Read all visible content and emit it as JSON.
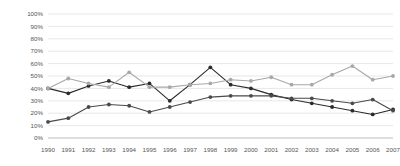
{
  "chart_data": {
    "type": "line",
    "title": "",
    "subtitle": "",
    "xlabel": "",
    "ylabel": "",
    "grid": true,
    "legend": "none",
    "ylim": [
      0,
      100
    ],
    "y_ticks": [
      "0%",
      "10%",
      "20%",
      "30%",
      "40%",
      "50%",
      "60%",
      "70%",
      "80%",
      "90%",
      "100%"
    ],
    "y_tick_values": [
      0,
      10,
      20,
      30,
      40,
      50,
      60,
      70,
      80,
      90,
      100
    ],
    "categories": [
      "1990",
      "1991",
      "1992",
      "1993",
      "1994",
      "1995",
      "1996",
      "1997",
      "1998",
      "1999",
      "2000",
      "2001",
      "2002",
      "2003",
      "2004",
      "2005",
      "2006",
      "2007"
    ],
    "x": [
      1990,
      1991,
      1992,
      1993,
      1994,
      1995,
      1996,
      1997,
      1998,
      1999,
      2000,
      2001,
      2002,
      2003,
      2004,
      2005,
      2006,
      2007
    ],
    "series": [
      {
        "name": "series-dark",
        "color": "#2b2b2b",
        "marker": "circle",
        "values": [
          40,
          36,
          42,
          46,
          41,
          44,
          30,
          43,
          57,
          43,
          40,
          35,
          31,
          28,
          25,
          22,
          19,
          23
        ]
      },
      {
        "name": "series-light",
        "color": "#a8a8a8",
        "marker": "circle",
        "values": [
          40,
          48,
          44,
          41,
          53,
          41,
          41,
          43,
          44,
          47,
          46,
          49,
          43,
          43,
          51,
          58,
          47,
          50
        ]
      },
      {
        "name": "series-mid",
        "color": "#4a4a4a",
        "marker": "circle",
        "values": [
          13,
          16,
          25,
          27,
          26,
          21,
          25,
          29,
          33,
          34,
          34,
          34,
          32,
          32,
          30,
          28,
          31,
          22
        ]
      }
    ]
  },
  "axis": {
    "y_label_suffix": "%"
  }
}
